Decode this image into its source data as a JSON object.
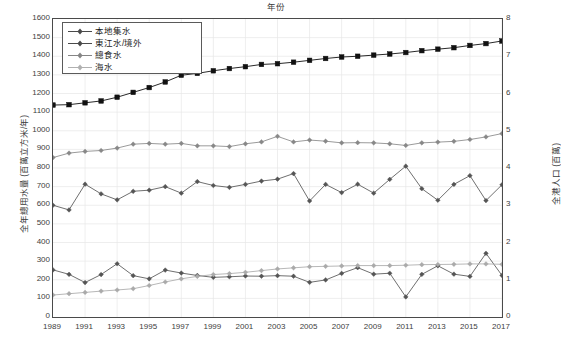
{
  "chart_data": {
    "type": "line",
    "title": "",
    "xlabel": "年份",
    "ylabel": "全年總用水量 (百萬立方米/年)",
    "ylabel_right": "全港人口 (百萬)",
    "x": [
      1989,
      1990,
      1991,
      1992,
      1993,
      1994,
      1995,
      1996,
      1997,
      1998,
      1999,
      2000,
      2001,
      2002,
      2003,
      2004,
      2005,
      2006,
      2007,
      2008,
      2009,
      2010,
      2011,
      2012,
      2013,
      2014,
      2015,
      2016,
      2017
    ],
    "xlim": [
      1989,
      2017
    ],
    "ylim": [
      0,
      1600
    ],
    "ylim_right": [
      0,
      8
    ],
    "ytick_step": 100,
    "ytick_step_right": 1,
    "xtick_step": 2,
    "grid": true,
    "legend_position": "top-left",
    "series": [
      {
        "name": "本地集水",
        "axis": "left",
        "marker": "diamond",
        "color": "#555555",
        "values": [
          253,
          229,
          185,
          228,
          286,
          222,
          205,
          252,
          236,
          223,
          213,
          216,
          220,
          219,
          222,
          219,
          186,
          199,
          234,
          265,
          230,
          235,
          108,
          229,
          275,
          230,
          218,
          342,
          223
        ]
      },
      {
        "name": "東江水/境外",
        "axis": "left",
        "marker": "diamond",
        "color": "#555555",
        "values": [
          600,
          575,
          713,
          661,
          629,
          675,
          681,
          700,
          665,
          727,
          706,
          696,
          712,
          730,
          740,
          770,
          623,
          712,
          668,
          713,
          665,
          739,
          810,
          689,
          627,
          712,
          759,
          625,
          710
        ]
      },
      {
        "name": "總食水",
        "axis": "left",
        "marker": "diamond",
        "color": "#888888",
        "values": [
          856,
          880,
          889,
          894,
          907,
          928,
          932,
          928,
          932,
          919,
          919,
          915,
          930,
          940,
          970,
          940,
          950,
          944,
          935,
          936,
          935,
          930,
          921,
          935,
          939,
          943,
          953,
          967,
          985
        ]
      },
      {
        "name": "海水",
        "axis": "left",
        "marker": "diamond",
        "color": "#aaaaaa",
        "values": [
          118,
          125,
          132,
          139,
          145,
          152,
          169,
          188,
          205,
          218,
          228,
          233,
          240,
          249,
          258,
          264,
          270,
          272,
          274,
          276,
          276,
          276,
          278,
          281,
          282,
          283,
          285,
          285,
          283
        ]
      },
      {
        "name": "population",
        "axis": "right",
        "marker": "square",
        "color": "#111111",
        "values": [
          5.69,
          5.7,
          5.75,
          5.8,
          5.9,
          6.03,
          6.16,
          6.31,
          6.49,
          6.54,
          6.61,
          6.67,
          6.72,
          6.78,
          6.8,
          6.84,
          6.89,
          6.94,
          6.98,
          7.0,
          7.03,
          7.06,
          7.1,
          7.15,
          7.19,
          7.23,
          7.29,
          7.34,
          7.41
        ]
      }
    ],
    "legend": [
      {
        "label": "本地集水",
        "marker": "diamond",
        "color": "#4a4a4a"
      },
      {
        "label": "東江水/境外",
        "marker": "diamond",
        "color": "#4a4a4a"
      },
      {
        "label": "總食水",
        "marker": "diamond",
        "color": "#858585"
      },
      {
        "label": "海水",
        "marker": "diamond",
        "color": "#b0b0b0"
      }
    ],
    "yticks_left": [
      "0",
      "100",
      "200",
      "300",
      "400",
      "500",
      "600",
      "700",
      "800",
      "900",
      "1000",
      "1100",
      "1200",
      "1300",
      "1400",
      "1500",
      "1600"
    ],
    "yticks_right": [
      "0",
      "1",
      "2",
      "3",
      "4",
      "5",
      "6",
      "7",
      "8"
    ],
    "xticks": [
      "1989",
      "1991",
      "1993",
      "1995",
      "1997",
      "1999",
      "2001",
      "2003",
      "2005",
      "2007",
      "2009",
      "2011",
      "2013",
      "2015",
      "2017"
    ]
  }
}
